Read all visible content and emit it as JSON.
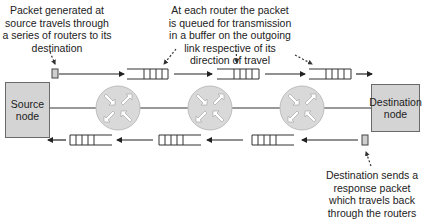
{
  "annotations": {
    "source_packet": "Packet generated at source travels through a series of routers to its destination",
    "router_queue": "At each router the packet is queued for transmission in a buffer on the outgoing link respective of its direction of travel",
    "destination_response": "Destination sends a response packet which travels back through the routers"
  },
  "nodes": {
    "source": "Source node",
    "destination": "Destination node"
  },
  "routers": [
    {
      "name": "router-1"
    },
    {
      "name": "router-2"
    },
    {
      "name": "router-3"
    }
  ],
  "colors": {
    "node_fill": "#d4d4d4",
    "router_fill": "#d9d9d9",
    "line": "#333333"
  }
}
